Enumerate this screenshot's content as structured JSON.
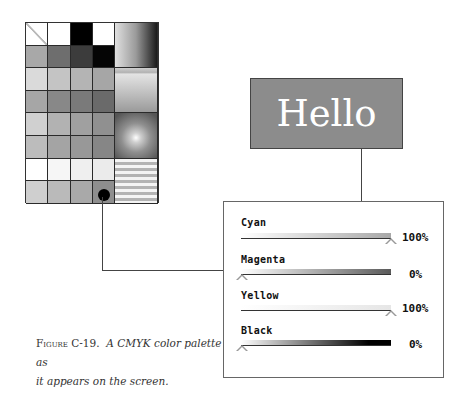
{
  "palette": {
    "small_cells": [
      [
        "diagonal",
        "#ffffff",
        "#000000",
        "#ffffff"
      ],
      [
        "#a8a8a8",
        "#6e6e6e",
        "#3c3c3c",
        "#050505"
      ],
      [
        "#dadada",
        "#c4c4c4",
        "#b4b4b4",
        "#a6a6a6"
      ],
      [
        "#a6a6a6",
        "#888888",
        "#7a7a7a",
        "#6a6a6a"
      ],
      [
        "#d0d0d0",
        "#b2b2b2",
        "#a0a0a0",
        "#909090"
      ],
      [
        "#bcbcbc",
        "#a4a4a4",
        "#989898",
        "#868686"
      ],
      [
        "#ffffff",
        "#f6f6f6",
        "#efefef",
        "#ebebeb"
      ],
      [
        "#cfcfcf",
        "#bababa",
        "#a9a9a9",
        "#8e8e8e"
      ]
    ],
    "large_cells": [
      "horizontal-gradient",
      "vertical-gradient",
      "radial-gradient",
      "stripes"
    ],
    "selected_cell": {
      "row": 7,
      "col": 3
    }
  },
  "preview": {
    "text": "Hello",
    "background": "#8c8c8c",
    "text_color": "#ffffff"
  },
  "channels": [
    {
      "label": "Cyan",
      "value": "100%",
      "position": 1.0
    },
    {
      "label": "Magenta",
      "value": "0%",
      "position": 0.0
    },
    {
      "label": "Yellow",
      "value": "100%",
      "position": 1.0
    },
    {
      "label": "Black",
      "value": "0%",
      "position": 0.0
    }
  ],
  "caption": {
    "figure_label": "Figure C-19.",
    "text_line1": "A CMYK color palette as",
    "text_line2": "it appears on the screen."
  }
}
